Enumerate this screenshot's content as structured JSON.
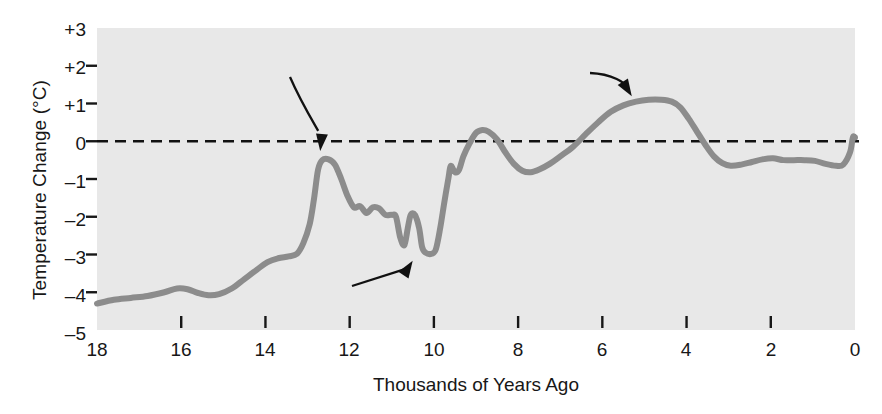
{
  "chart_data": {
    "type": "line",
    "title": "",
    "xlabel": "Thousands of Years Ago",
    "ylabel": "Temperature Change (°C)",
    "xlim": [
      18,
      0
    ],
    "ylim": [
      -5,
      3
    ],
    "x_ticks": [
      "18",
      "16",
      "14",
      "12",
      "10",
      "8",
      "6",
      "4",
      "2",
      "0"
    ],
    "x_tick_values": [
      18,
      16,
      14,
      12,
      10,
      8,
      6,
      4,
      2,
      0
    ],
    "y_ticks": [
      "+3",
      "+2",
      "+1",
      "0",
      "–1",
      "–2",
      "–3",
      "–4",
      "–5"
    ],
    "y_tick_values": [
      3,
      2,
      1,
      0,
      -1,
      -2,
      -3,
      -4,
      -5
    ],
    "x_axis_inverted": true,
    "grid": false,
    "legend": "none",
    "plot_background": "#e8e8e8",
    "line_color": "#8c8c8c",
    "line_width": 6,
    "reference_line": {
      "value": 0,
      "style": "dashed",
      "color": "#111111",
      "label": "0 °C baseline"
    },
    "series": [
      {
        "name": "Temperature Change",
        "points": [
          [
            18.0,
            -4.3
          ],
          [
            17.6,
            -4.2
          ],
          [
            17.2,
            -4.15
          ],
          [
            16.8,
            -4.1
          ],
          [
            16.4,
            -4.0
          ],
          [
            16.1,
            -3.9
          ],
          [
            15.85,
            -3.92
          ],
          [
            15.6,
            -4.02
          ],
          [
            15.35,
            -4.08
          ],
          [
            15.1,
            -4.05
          ],
          [
            14.8,
            -3.9
          ],
          [
            14.5,
            -3.65
          ],
          [
            14.2,
            -3.4
          ],
          [
            13.95,
            -3.2
          ],
          [
            13.7,
            -3.1
          ],
          [
            13.45,
            -3.05
          ],
          [
            13.25,
            -2.98
          ],
          [
            13.1,
            -2.7
          ],
          [
            12.95,
            -2.2
          ],
          [
            12.85,
            -1.55
          ],
          [
            12.75,
            -0.75
          ],
          [
            12.65,
            -0.5
          ],
          [
            12.5,
            -0.48
          ],
          [
            12.35,
            -0.62
          ],
          [
            12.2,
            -1.0
          ],
          [
            12.05,
            -1.45
          ],
          [
            11.9,
            -1.75
          ],
          [
            11.75,
            -1.72
          ],
          [
            11.6,
            -1.9
          ],
          [
            11.45,
            -1.75
          ],
          [
            11.3,
            -1.78
          ],
          [
            11.15,
            -1.95
          ],
          [
            11.0,
            -1.95
          ],
          [
            10.9,
            -2.0
          ],
          [
            10.8,
            -2.55
          ],
          [
            10.7,
            -2.75
          ],
          [
            10.62,
            -2.3
          ],
          [
            10.55,
            -1.95
          ],
          [
            10.45,
            -1.95
          ],
          [
            10.35,
            -2.3
          ],
          [
            10.28,
            -2.8
          ],
          [
            10.2,
            -2.95
          ],
          [
            10.05,
            -2.98
          ],
          [
            9.95,
            -2.85
          ],
          [
            9.85,
            -2.3
          ],
          [
            9.75,
            -1.6
          ],
          [
            9.65,
            -0.95
          ],
          [
            9.6,
            -0.65
          ],
          [
            9.5,
            -0.82
          ],
          [
            9.4,
            -0.75
          ],
          [
            9.3,
            -0.4
          ],
          [
            9.15,
            -0.05
          ],
          [
            9.0,
            0.22
          ],
          [
            8.85,
            0.3
          ],
          [
            8.7,
            0.25
          ],
          [
            8.5,
            0.05
          ],
          [
            8.3,
            -0.3
          ],
          [
            8.1,
            -0.6
          ],
          [
            7.9,
            -0.78
          ],
          [
            7.7,
            -0.82
          ],
          [
            7.5,
            -0.75
          ],
          [
            7.25,
            -0.6
          ],
          [
            7.0,
            -0.4
          ],
          [
            6.7,
            -0.15
          ],
          [
            6.4,
            0.18
          ],
          [
            6.1,
            0.5
          ],
          [
            5.8,
            0.78
          ],
          [
            5.5,
            0.95
          ],
          [
            5.2,
            1.05
          ],
          [
            4.9,
            1.1
          ],
          [
            4.6,
            1.1
          ],
          [
            4.35,
            1.05
          ],
          [
            4.15,
            0.9
          ],
          [
            3.95,
            0.6
          ],
          [
            3.75,
            0.25
          ],
          [
            3.55,
            -0.1
          ],
          [
            3.35,
            -0.4
          ],
          [
            3.15,
            -0.58
          ],
          [
            2.95,
            -0.65
          ],
          [
            2.7,
            -0.62
          ],
          [
            2.45,
            -0.55
          ],
          [
            2.2,
            -0.48
          ],
          [
            1.95,
            -0.45
          ],
          [
            1.7,
            -0.5
          ],
          [
            1.45,
            -0.5
          ],
          [
            1.2,
            -0.5
          ],
          [
            0.95,
            -0.52
          ],
          [
            0.7,
            -0.6
          ],
          [
            0.45,
            -0.65
          ],
          [
            0.28,
            -0.62
          ],
          [
            0.12,
            -0.3
          ],
          [
            0.05,
            0.1
          ],
          [
            0.0,
            0.1
          ]
        ]
      }
    ],
    "annotations": [
      {
        "id": "bolling-allerod",
        "text": "Bölling-Alleröd",
        "points_to": {
          "x": 12.7,
          "y": -0.15
        },
        "arrow": "curved-down"
      },
      {
        "id": "younger-dryas",
        "text": "Younger-Dryas",
        "points_to": {
          "x": 10.55,
          "y": -2.85
        },
        "arrow": "straight-up-right"
      },
      {
        "id": "holocene-maximum",
        "text": "Holocene\nmaximum",
        "line1": "Holocene",
        "line2": "maximum",
        "points_to": {
          "x": 5.3,
          "y": 1.06
        },
        "arrow": "curved-down-right"
      }
    ]
  }
}
